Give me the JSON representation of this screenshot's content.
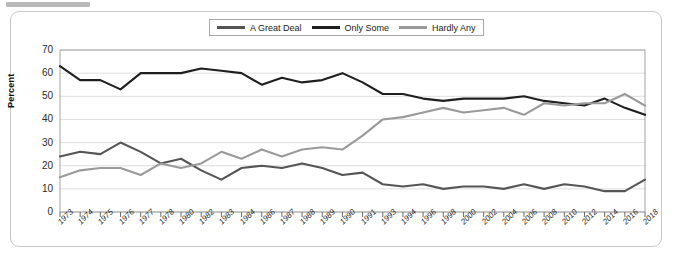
{
  "chart_data": {
    "type": "line",
    "title": "",
    "xlabel": "",
    "ylabel": "Percent",
    "ylim": [
      0,
      70
    ],
    "yticks": [
      0,
      10,
      20,
      30,
      40,
      50,
      60,
      70
    ],
    "grid": true,
    "legend_position": "top-center",
    "categories": [
      "1973",
      "1974",
      "1975",
      "1976",
      "1977",
      "1978",
      "1980",
      "1982",
      "1983",
      "1984",
      "1986",
      "1987",
      "1988",
      "1989",
      "1990",
      "1991",
      "1993",
      "1994",
      "1996",
      "1998",
      "2000",
      "2002",
      "2004",
      "2006",
      "2008",
      "2010",
      "2012",
      "2014",
      "2016",
      "2018"
    ],
    "series": [
      {
        "name": "A Great Deal",
        "color": "#555555",
        "values": [
          24,
          26,
          25,
          30,
          26,
          21,
          23,
          18,
          14,
          19,
          20,
          19,
          21,
          19,
          16,
          17,
          12,
          11,
          12,
          10,
          11,
          11,
          10,
          12,
          10,
          12,
          11,
          9,
          9,
          14
        ]
      },
      {
        "name": "Only Some",
        "color": "#1f1f1f",
        "values": [
          63,
          57,
          57,
          53,
          60,
          60,
          60,
          62,
          61,
          60,
          55,
          58,
          56,
          57,
          60,
          56,
          51,
          51,
          49,
          48,
          49,
          49,
          49,
          50,
          48,
          47,
          46,
          49,
          45,
          42
        ]
      },
      {
        "name": "Hardly Any",
        "color": "#9a9a9a",
        "values": [
          15,
          18,
          19,
          19,
          16,
          21,
          19,
          21,
          26,
          23,
          27,
          24,
          27,
          28,
          27,
          33,
          40,
          41,
          43,
          45,
          43,
          44,
          45,
          42,
          47,
          46,
          47,
          47,
          51,
          46
        ]
      }
    ]
  },
  "legend": {
    "items": [
      {
        "label": "A Great Deal",
        "color": "#555555"
      },
      {
        "label": "Only Some",
        "color": "#1f1f1f"
      },
      {
        "label": "Hardly Any",
        "color": "#9a9a9a"
      }
    ]
  },
  "axis": {
    "y_title": "Percent"
  }
}
